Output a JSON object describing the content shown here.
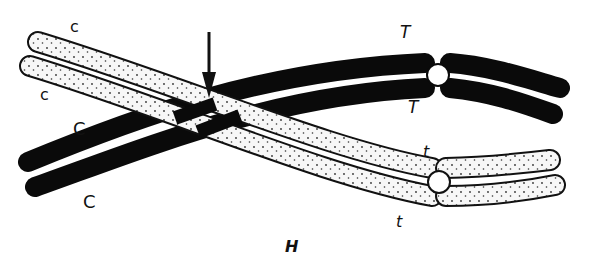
{
  "figure": {
    "panel_label": "H",
    "colors": {
      "dark_chromosome": "#0a0a0a",
      "light_chromosome_fill": "#f7f7f7",
      "outline": "#111111",
      "background": "#ffffff"
    },
    "labels": {
      "light_upper_left_1": "c",
      "light_upper_left_2": "c",
      "dark_left_1": "C",
      "dark_left_2": "C",
      "dark_right_top": "T",
      "dark_right_bottom": "T",
      "light_right_top": "t",
      "light_right_bottom": "t"
    },
    "markers": {
      "chiasma_arrow": "arrow-down",
      "centromeres": 2
    }
  }
}
